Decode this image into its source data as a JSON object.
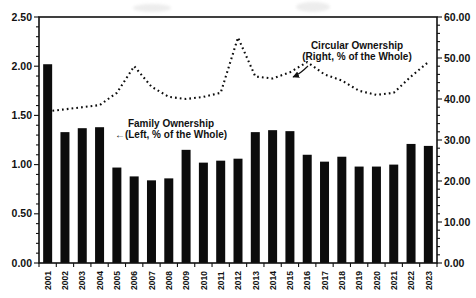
{
  "chart_data": {
    "type": "bar",
    "subtype": "combo-bar-dotted-line",
    "title": "",
    "categories": [
      "2001",
      "2002",
      "2003",
      "2004",
      "2005",
      "2006",
      "2007",
      "2008",
      "2009",
      "2010",
      "2011",
      "2012",
      "2013",
      "2014",
      "2015",
      "2016",
      "2017",
      "2018",
      "2019",
      "2020",
      "2021",
      "2022",
      "2023"
    ],
    "series": [
      {
        "name": "Family Ownership",
        "type": "bar",
        "axis": "left",
        "color": "#0c0c0c",
        "values": [
          2.02,
          1.33,
          1.37,
          1.38,
          0.97,
          0.88,
          0.84,
          0.86,
          1.15,
          1.02,
          1.04,
          1.06,
          1.33,
          1.35,
          1.34,
          1.1,
          1.03,
          1.08,
          0.98,
          0.98,
          1.0,
          1.21,
          1.19
        ]
      },
      {
        "name": "Circular Ownership",
        "type": "line-dotted",
        "axis": "right",
        "color": "#0c0c0c",
        "values": [
          37,
          37.5,
          38,
          38.5,
          41.5,
          48,
          43,
          40.5,
          40,
          40.5,
          41.5,
          55,
          45.5,
          45,
          46.5,
          49,
          46,
          44.5,
          42,
          41,
          41.5,
          45.5,
          49
        ]
      }
    ],
    "left_axis": {
      "min": 0,
      "max": 2.5,
      "major_step": 0.5,
      "minor_step": 0.1,
      "tick_labels": [
        "0.00",
        "0.50",
        "1.00",
        "1.50",
        "2.00",
        "2.50"
      ]
    },
    "right_axis": {
      "min": 0,
      "max": 60,
      "major_step": 10,
      "minor_step": 2,
      "tick_labels": [
        "0.00",
        "10.00",
        "20.00",
        "30.00",
        "40.00",
        "50.00",
        "60.00"
      ]
    },
    "grid": "off",
    "legend": "none",
    "annotations": {
      "family": {
        "line1": "Family Ownership",
        "line2": "←(Left, % of the Whole)"
      },
      "circular": {
        "line1": "Circular Ownership",
        "line2": "(Right, % of the Whole)"
      }
    },
    "frame_color": "#111111",
    "background": "#ffffff"
  }
}
